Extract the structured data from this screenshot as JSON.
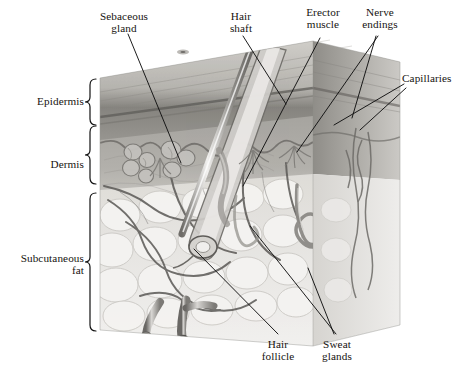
{
  "figure": {
    "style": "grayscale anatomical illustration",
    "colors": {
      "background": "#ffffff",
      "epidermis_surface": "#b9b7b2",
      "epidermis_band": "#8e8c88",
      "dermis": "#a3a19c",
      "subcutaneous_fat": "#e3e3e1",
      "right_face": "#9b9995",
      "leader_line": "#1a1a1a",
      "hair": "#8c8a86",
      "vessel": "#5d5b58"
    }
  },
  "layer_brackets": [
    {
      "label": "Epidermis",
      "id": "epidermis"
    },
    {
      "label": "Dermis",
      "id": "dermis"
    },
    {
      "label": "Subcutaneous\nfat",
      "id": "subcutaneous-fat"
    }
  ],
  "callouts": [
    {
      "id": "sebaceous-gland",
      "label": "Sebaceous\ngland"
    },
    {
      "id": "hair-shaft",
      "label": "Hair\nshaft"
    },
    {
      "id": "erector-muscle",
      "label": "Erector\nmuscle"
    },
    {
      "id": "nerve-endings",
      "label": "Nerve\nendings"
    },
    {
      "id": "capillaries",
      "label": "Capillaries"
    },
    {
      "id": "hair-follicle",
      "label": "Hair\nfollicle"
    },
    {
      "id": "sweat-glands",
      "label": "Sweat\nglands"
    }
  ]
}
